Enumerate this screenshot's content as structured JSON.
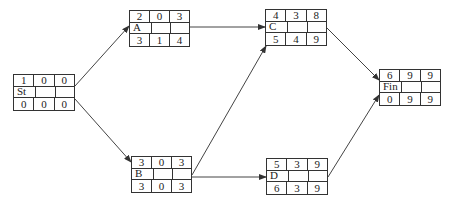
{
  "diagram": {
    "type": "activity-on-node network",
    "nodes": [
      {
        "id": "St",
        "top": [
          "1",
          "0",
          "0"
        ],
        "name": "St",
        "bottom": [
          "0",
          "0",
          "0"
        ],
        "x": 13,
        "y": 74,
        "w": 62,
        "h": 37
      },
      {
        "id": "A",
        "top": [
          "2",
          "0",
          "3"
        ],
        "name": "A",
        "bottom": [
          "3",
          "1",
          "4"
        ],
        "x": 129,
        "y": 10,
        "w": 61,
        "h": 37
      },
      {
        "id": "B",
        "top": [
          "3",
          "0",
          "3"
        ],
        "name": "B",
        "bottom": [
          "3",
          "0",
          "3"
        ],
        "x": 131,
        "y": 156,
        "w": 61,
        "h": 37
      },
      {
        "id": "C",
        "top": [
          "4",
          "3",
          "8"
        ],
        "name": "C",
        "bottom": [
          "5",
          "4",
          "9"
        ],
        "x": 265,
        "y": 9,
        "w": 62,
        "h": 37
      },
      {
        "id": "D",
        "top": [
          "5",
          "3",
          "9"
        ],
        "name": "D",
        "bottom": [
          "6",
          "3",
          "9"
        ],
        "x": 266,
        "y": 158,
        "w": 62,
        "h": 37
      },
      {
        "id": "Fin",
        "top": [
          "6",
          "9",
          "9"
        ],
        "name": "Fin",
        "bottom": [
          "0",
          "9",
          "9"
        ],
        "x": 379,
        "y": 69,
        "w": 62,
        "h": 37
      }
    ],
    "edges": [
      {
        "from": "St",
        "to": "A"
      },
      {
        "from": "St",
        "to": "B"
      },
      {
        "from": "A",
        "to": "C"
      },
      {
        "from": "B",
        "to": "C"
      },
      {
        "from": "B",
        "to": "D"
      },
      {
        "from": "C",
        "to": "Fin"
      },
      {
        "from": "D",
        "to": "Fin"
      }
    ]
  }
}
